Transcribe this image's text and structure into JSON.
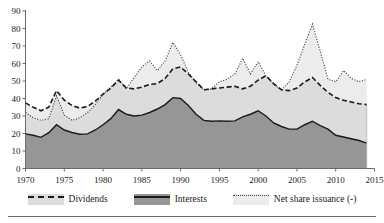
{
  "chart_data": {
    "type": "area",
    "title": "",
    "subtitle": "",
    "xlabel": "",
    "ylabel": "",
    "xlim": [
      1970,
      2015
    ],
    "ylim": [
      0,
      90
    ],
    "grid": false,
    "legend_position": "bottom",
    "xticks": [
      1970,
      1975,
      1980,
      1985,
      1990,
      1995,
      2000,
      2005,
      2010,
      2015
    ],
    "yticks": [
      0,
      10,
      20,
      30,
      40,
      50,
      60,
      70,
      80,
      90
    ],
    "x": [
      1970,
      1971,
      1972,
      1973,
      1974,
      1975,
      1976,
      1977,
      1978,
      1979,
      1980,
      1981,
      1982,
      1983,
      1984,
      1985,
      1986,
      1987,
      1988,
      1989,
      1990,
      1991,
      1992,
      1993,
      1994,
      1995,
      1996,
      1997,
      1998,
      1999,
      2000,
      2001,
      2002,
      2003,
      2004,
      2005,
      2006,
      2007,
      2008,
      2009,
      2010,
      2011,
      2012,
      2013,
      2014
    ],
    "series": [
      {
        "name": "Interests",
        "style": "filled-dark-solid-edge",
        "color": "#969696",
        "values": [
          19.8,
          19.0,
          17.8,
          20.5,
          25.0,
          22.0,
          20.6,
          19.6,
          19.8,
          22.0,
          25.0,
          28.5,
          33.7,
          31.0,
          30.0,
          30.5,
          32.0,
          34.0,
          36.5,
          40.5,
          40.0,
          36.0,
          31.0,
          27.5,
          27.0,
          27.2,
          27.0,
          27.2,
          29.5,
          31.0,
          33.0,
          30.0,
          26.0,
          24.0,
          22.5,
          22.5,
          25.0,
          27.0,
          24.5,
          22.5,
          19.0,
          18.0,
          17.0,
          16.0,
          14.5
        ]
      },
      {
        "name": "Dividends",
        "style": "cumulative-dashed",
        "color": "#dcdcdc",
        "values": [
          37.5,
          35.0,
          33.0,
          35.0,
          44.5,
          39.0,
          36.0,
          34.5,
          35.5,
          38.5,
          42.5,
          46.0,
          50.5,
          46.0,
          45.5,
          46.5,
          48.0,
          48.5,
          51.5,
          57.0,
          58.0,
          54.0,
          49.5,
          45.0,
          45.5,
          46.0,
          46.5,
          47.0,
          45.5,
          47.0,
          50.5,
          53.0,
          48.5,
          45.0,
          44.5,
          46.0,
          49.5,
          52.0,
          47.5,
          43.5,
          40.5,
          39.0,
          38.0,
          37.0,
          36.5
        ]
      },
      {
        "name": "Net share issuance (-)",
        "style": "cumulative-dotted",
        "color": "#4a4a4a",
        "values": [
          32.0,
          29.0,
          27.5,
          28.5,
          41.5,
          30.5,
          27.5,
          29.0,
          32.0,
          36.5,
          42.5,
          46.5,
          51.0,
          45.5,
          52.0,
          58.0,
          61.5,
          56.0,
          61.5,
          72.0,
          65.0,
          55.0,
          49.0,
          45.0,
          45.5,
          49.5,
          51.0,
          54.0,
          63.0,
          54.0,
          61.0,
          53.0,
          48.0,
          45.0,
          49.5,
          59.0,
          71.0,
          82.5,
          67.0,
          51.0,
          49.5,
          56.0,
          51.5,
          49.5,
          51.0
        ]
      }
    ]
  },
  "legend": {
    "items": [
      {
        "label": "Dividends",
        "swatch": "light-band-dashed",
        "fill": "#dcdcdc",
        "line": "#1a1a1a",
        "line_style": "dashed"
      },
      {
        "label": "Interests",
        "swatch": "dark-band-solid",
        "fill": "#969696",
        "line": "#1a1a1a",
        "line_style": "solid"
      },
      {
        "label": "Net share issuance (-)",
        "swatch": "light-band-dotted",
        "fill": "#ececec",
        "line": "#4a4a4a",
        "line_style": "dotted"
      }
    ]
  },
  "axis": {
    "y_tick_labels": [
      "0",
      "10",
      "20",
      "30",
      "40",
      "50",
      "60",
      "70",
      "80",
      "90"
    ],
    "x_tick_labels": [
      "1970",
      "1975",
      "1980",
      "1985",
      "1990",
      "1995",
      "2000",
      "2005",
      "2010",
      "2015"
    ]
  },
  "colors": {
    "interests_fill": "#969696",
    "dividends_fill": "#dcdcdc",
    "axis": "#6a6a6a",
    "line_dark": "#1a1a1a",
    "line_dotted": "#4a4a4a",
    "background": "#ffffff"
  }
}
